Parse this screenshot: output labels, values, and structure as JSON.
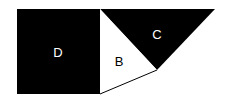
{
  "diagram": {
    "regions": [
      {
        "id": "D",
        "label": "D",
        "shape": "square",
        "fill": "#000000",
        "text_color": "#ffffff"
      },
      {
        "id": "B",
        "label": "B",
        "shape": "triangle",
        "fill": "#ffffff",
        "text_color": "#000000"
      },
      {
        "id": "C",
        "label": "C",
        "shape": "triangle",
        "fill": "#000000",
        "text_color": "#ffffff"
      }
    ]
  }
}
